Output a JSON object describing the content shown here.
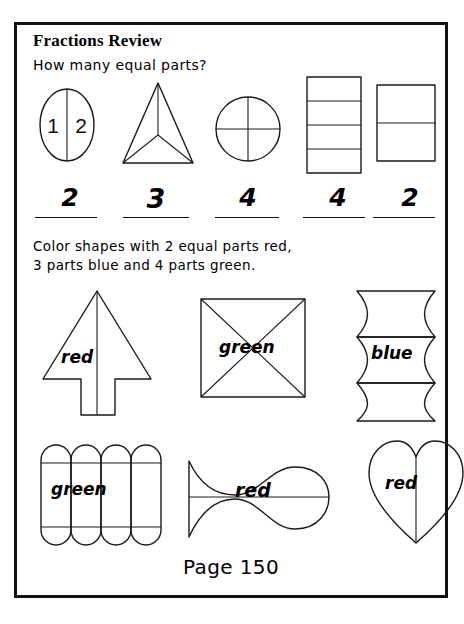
{
  "worksheet": {
    "title": "Fractions Review",
    "prompt": "How many equal parts?",
    "instructions_line1": "Color shapes with 2 equal parts red,",
    "instructions_line2": "3 parts blue and 4 parts green.",
    "page_number": "Page 150",
    "ink_color": "#1a1a1a",
    "paper_color": "#ffffff"
  },
  "parts_exercises": [
    {
      "shape": "oval",
      "divisions": 2,
      "answer": "2",
      "inner_labels": [
        "1",
        "2"
      ]
    },
    {
      "shape": "triangle",
      "divisions": 3,
      "answer": "3",
      "inner_labels": []
    },
    {
      "shape": "circle",
      "divisions": 4,
      "answer": "4",
      "inner_labels": []
    },
    {
      "shape": "rectangle-4-bands",
      "divisions": 4,
      "answer": "4",
      "inner_labels": []
    },
    {
      "shape": "rectangle-2-bands",
      "divisions": 2,
      "answer": "2",
      "inner_labels": []
    }
  ],
  "color_exercises": [
    {
      "shape": "arrow-tree",
      "divisions": 2,
      "label": "red"
    },
    {
      "shape": "square-diagonals",
      "divisions": 4,
      "label": "green"
    },
    {
      "shape": "scalloped-column",
      "divisions": 3,
      "label": "blue"
    },
    {
      "shape": "capsule-grid",
      "divisions": 4,
      "label": "green"
    },
    {
      "shape": "fish",
      "divisions": 2,
      "label": "red"
    },
    {
      "shape": "heart",
      "divisions": 2,
      "label": "red"
    }
  ]
}
